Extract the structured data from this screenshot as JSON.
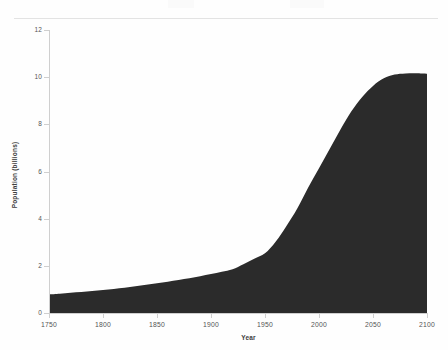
{
  "page": {
    "background_color": "#fefefe",
    "rule_color": "#e3e3e3"
  },
  "chart_data": {
    "type": "area",
    "title": "",
    "subtitle": "",
    "xlabel": "Year",
    "ylabel": "Population (billions)",
    "xlim": [
      1750,
      2100
    ],
    "ylim": [
      0,
      12
    ],
    "xticks": [
      1750,
      1800,
      1850,
      1900,
      1950,
      2000,
      2050,
      2100
    ],
    "xtick_labels": [
      "1750",
      "1800",
      "1850",
      "1900",
      "1950",
      "2000",
      "2050",
      "2100"
    ],
    "yticks": [
      0,
      2,
      4,
      6,
      8,
      10,
      12
    ],
    "ytick_labels": [
      "0",
      "2",
      "4",
      "6",
      "8",
      "10",
      "12"
    ],
    "grid": false,
    "legend": false,
    "legend_position": "none",
    "fill_color": "#2b2b2b",
    "line_color": "#2b2b2b",
    "x": [
      1750,
      1760,
      1770,
      1780,
      1790,
      1800,
      1810,
      1820,
      1830,
      1840,
      1850,
      1860,
      1870,
      1880,
      1890,
      1900,
      1910,
      1920,
      1930,
      1940,
      1950,
      1960,
      1970,
      1980,
      1990,
      2000,
      2010,
      2020,
      2030,
      2040,
      2050,
      2060,
      2070,
      2080,
      2090,
      2100
    ],
    "values": [
      0.79,
      0.82,
      0.86,
      0.89,
      0.93,
      0.98,
      1.02,
      1.07,
      1.13,
      1.2,
      1.26,
      1.33,
      1.4,
      1.47,
      1.56,
      1.65,
      1.75,
      1.86,
      2.07,
      2.3,
      2.53,
      3.03,
      3.7,
      4.44,
      5.32,
      6.14,
      6.96,
      7.79,
      8.55,
      9.16,
      9.63,
      9.95,
      10.11,
      10.16,
      10.17,
      10.15
    ],
    "units": "billions",
    "series_name": "World population"
  }
}
